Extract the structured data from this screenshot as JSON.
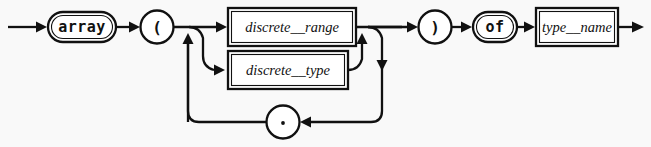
{
  "diagram": {
    "kind": "railroad-syntax-diagram",
    "rule_name": "array_type_definition",
    "background_color": "#f9f9f9",
    "line_color": "#111111",
    "node_fill_color": "#ffffff",
    "nodes": [
      {
        "id": "array",
        "label": "array",
        "shape": "stadium",
        "style": "terminal-keyword"
      },
      {
        "id": "lparen",
        "label": "(",
        "shape": "circle",
        "style": "terminal-punct"
      },
      {
        "id": "discrete_range",
        "label": "discrete__range",
        "shape": "rectangle",
        "style": "nonterminal"
      },
      {
        "id": "discrete_type",
        "label": "discrete__type",
        "shape": "rectangle",
        "style": "nonterminal"
      },
      {
        "id": "comma",
        "label": ",",
        "shape": "circle",
        "style": "terminal-punct"
      },
      {
        "id": "rparen",
        "label": ")",
        "shape": "circle",
        "style": "terminal-punct"
      },
      {
        "id": "of",
        "label": "of",
        "shape": "stadium",
        "style": "terminal-keyword"
      },
      {
        "id": "type_name",
        "label": "type__name",
        "shape": "rectangle",
        "style": "nonterminal"
      }
    ],
    "sequence": [
      "array",
      "lparen",
      "alternation",
      "rparen",
      "of",
      "type_name"
    ],
    "alternation": [
      "discrete_range",
      "discrete_type"
    ],
    "repetition_separator": "comma"
  }
}
